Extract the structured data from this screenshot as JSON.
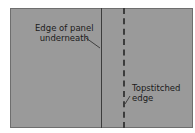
{
  "diagram": {
    "labels": [
      {
        "line1": "Edge of panel",
        "line2": "underneath"
      },
      {
        "line1": "Topstitched",
        "line2": "edge"
      }
    ],
    "colors": {
      "panel": "#9a9a9a",
      "lines": "#3c3c3c"
    }
  }
}
